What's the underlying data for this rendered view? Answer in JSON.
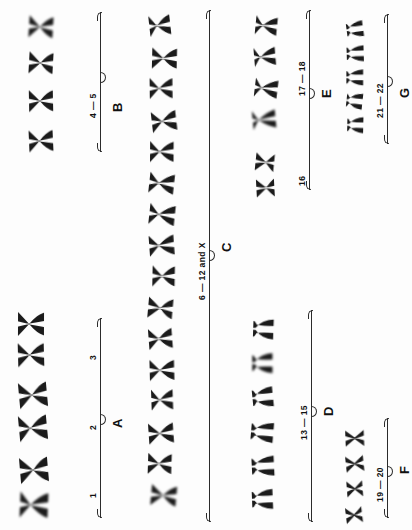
{
  "figure": {
    "orientation": "rotated-90-ccw",
    "background_color": "#fdfdfd",
    "ink_color": "#1b1b1b"
  },
  "groups": [
    {
      "id": "A",
      "group_label": "A",
      "number_labels": [
        "1",
        "2",
        "3"
      ],
      "chromosome_count": 6,
      "pairs": 3
    },
    {
      "id": "B",
      "group_label": "B",
      "number_labels": [
        "4 — 5"
      ],
      "chromosome_count": 4,
      "pairs": 2
    },
    {
      "id": "C",
      "group_label": "C",
      "number_labels": [
        "6 — 12 and X"
      ],
      "chromosome_count": 16,
      "pairs": 8
    },
    {
      "id": "D",
      "group_label": "D",
      "number_labels": [
        "13 — 15"
      ],
      "chromosome_count": 6,
      "pairs": 3
    },
    {
      "id": "E",
      "group_label": "E",
      "number_labels": [
        "16",
        "17 — 18"
      ],
      "chromosome_count": 6,
      "pairs": 3
    },
    {
      "id": "F",
      "group_label": "F",
      "number_labels": [
        "19 — 20"
      ],
      "chromosome_count": 4,
      "pairs": 2
    },
    {
      "id": "G",
      "group_label": "G",
      "number_labels": [
        "21 — 22"
      ],
      "chromosome_count": 5,
      "pairs": 2
    }
  ],
  "chart_data": {
    "type": "table",
    "xlabel": "",
    "ylabel": "",
    "categories": [
      "A",
      "B",
      "C",
      "D",
      "E",
      "F",
      "G"
    ],
    "values": [
      6,
      4,
      16,
      6,
      6,
      4,
      5
    ],
    "series": [
      {
        "name": "chromosomes shown",
        "values": [
          6,
          4,
          16,
          6,
          6,
          4,
          5
        ]
      }
    ],
    "annotations": [
      "1",
      "2",
      "3",
      "4 — 5",
      "6 — 12 and X",
      "13 — 15",
      "16",
      "17 — 18",
      "19 — 20",
      "21 — 22"
    ],
    "legend_position": "none",
    "grid": false
  }
}
